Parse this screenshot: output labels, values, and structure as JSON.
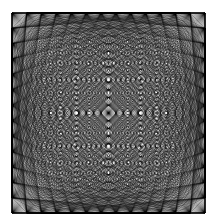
{
  "figure": {
    "title": "Square Complete-Graph String Art (Mystic Rose)",
    "background_color": "#ffffff",
    "line_color": "#000000"
  },
  "chart_data": {
    "type": "scatter",
    "title": "Square Complete-Graph String Art (Mystic Rose)",
    "subtitle": "",
    "xlabel": "",
    "ylabel": "",
    "grid": false,
    "legend": "none",
    "xlim": [
      0,
      216
    ],
    "ylim": [
      0,
      224
    ],
    "canvas": {
      "width": 216,
      "height": 224
    },
    "square": {
      "left": 12,
      "top": 13,
      "right": 205,
      "bottom": 213,
      "side_px": 193
    },
    "nodes": {
      "per_side": 14,
      "total_unique": 52,
      "placement": "evenly spaced along each edge of the square, corners shared between adjacent edges",
      "corner_points": [
        [
          12,
          13
        ],
        [
          205,
          13
        ],
        [
          205,
          213
        ],
        [
          12,
          213
        ]
      ]
    },
    "edges": {
      "rule": "complete-graph: every node connected to every other node",
      "count": 1326,
      "stroke_width": 0.32,
      "stroke_color": "#000000",
      "stroke_opacity": 0.82
    },
    "features": {
      "center": [
        108.5,
        113
      ],
      "center_void_shape": "diamond",
      "center_void_radius_px": 12,
      "star_points": 8,
      "symmetry": "4-fold rotational plus horizontal, vertical and diagonal mirror axes",
      "densest_regions": "perimeter node clusters and the ring immediately around the central diamond"
    },
    "margins": {
      "left": 12,
      "top": 13,
      "right": 11,
      "bottom": 11
    }
  }
}
